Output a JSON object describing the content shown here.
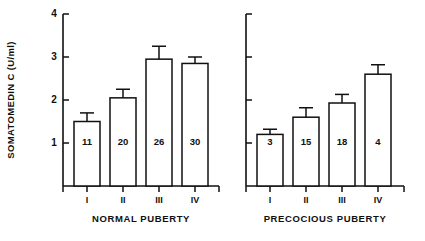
{
  "figure": {
    "background_color": "#ffffff",
    "ink_color": "#101010",
    "width": 425,
    "height": 241
  },
  "axis": {
    "y_label": "SOMATOMEDIN C (U/ml)",
    "y_ticks": [
      "1",
      "2",
      "3",
      "4"
    ],
    "y_tick_values": [
      1,
      2,
      3,
      4
    ]
  },
  "panels": [
    {
      "caption": "NORMAL PUBERTY",
      "categories": [
        "I",
        "II",
        "III",
        "IV"
      ],
      "n_labels": [
        "11",
        "20",
        "26",
        "30"
      ]
    },
    {
      "caption": "PRECOCIOUS PUBERTY",
      "categories": [
        "I",
        "II",
        "III",
        "IV"
      ],
      "n_labels": [
        "3",
        "15",
        "18",
        "4"
      ]
    }
  ],
  "chart_data": {
    "type": "bar",
    "title": "",
    "subtitle": "",
    "xlabel": "",
    "ylabel": "SOMATOMEDIN C (U/ml)",
    "ylim": [
      0,
      4
    ],
    "yticks": [
      1,
      2,
      3,
      4
    ],
    "grid": false,
    "legend": false,
    "orientation": "vertical",
    "error_bars": "upper only (SEM)",
    "panels": [
      {
        "name": "NORMAL PUBERTY",
        "categories": [
          "I",
          "II",
          "III",
          "IV"
        ],
        "values": [
          1.5,
          2.05,
          2.95,
          2.85
        ],
        "errors_upper": [
          0.2,
          0.2,
          0.3,
          0.15
        ],
        "n": [
          11,
          20,
          26,
          30
        ],
        "n_labels": [
          "11",
          "20",
          "26",
          "30"
        ]
      },
      {
        "name": "PRECOCIOUS PUBERTY",
        "categories": [
          "I",
          "II",
          "III",
          "IV"
        ],
        "values": [
          1.2,
          1.6,
          1.93,
          2.6
        ],
        "errors_upper": [
          0.12,
          0.22,
          0.2,
          0.22
        ],
        "n": [
          3,
          15,
          18,
          4
        ],
        "n_labels": [
          "3",
          "15",
          "18",
          "4"
        ]
      }
    ]
  }
}
